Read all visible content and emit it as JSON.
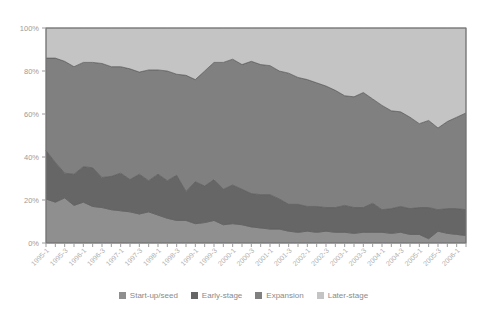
{
  "chart_data": {
    "type": "area",
    "title": "",
    "subtitle": "",
    "xlabel": "",
    "ylabel": "",
    "stacked": true,
    "percent_stacked": true,
    "grid": false,
    "legend_position": "bottom",
    "ylim": [
      0,
      100
    ],
    "ytick_labels": [
      "0%",
      "20%",
      "40%",
      "60%",
      "80%",
      "100%"
    ],
    "ytick_values": [
      0,
      20,
      40,
      60,
      80,
      100
    ],
    "x": [
      "1995-1",
      "1995-2",
      "1995-3",
      "1995-4",
      "1996-1",
      "1996-2",
      "1996-3",
      "1996-4",
      "1997-1",
      "1997-2",
      "1997-3",
      "1997-4",
      "1998-1",
      "1998-2",
      "1998-3",
      "1998-4",
      "1999-1",
      "1999-2",
      "1999-3",
      "1999-4",
      "2000-1",
      "2000-2",
      "2000-3",
      "2000-4",
      "2001-1",
      "2001-2",
      "2001-3",
      "2001-4",
      "2002-1",
      "2002-2",
      "2002-3",
      "2002-4",
      "2003-1",
      "2003-2",
      "2003-3",
      "2003-4",
      "2004-1",
      "2004-2",
      "2004-3",
      "2004-4",
      "2005-1",
      "2005-2",
      "2005-3",
      "2005-4",
      "2006-1",
      "2006-2"
    ],
    "xtick_labels": [
      "1995-1",
      "1995-3",
      "1996-1",
      "1996-3",
      "1997-1",
      "1997-3",
      "1998-1",
      "1998-3",
      "1999-1",
      "1999-3",
      "2000-1",
      "2000-3",
      "2001-1",
      "2001-3",
      "2002-1",
      "2002-3",
      "2003-1",
      "2003-3",
      "2004-1",
      "2004-3",
      "2005-1",
      "2005-3",
      "2006-1"
    ],
    "xtick_every": 2,
    "series": [
      {
        "name": "Start-up/seed",
        "color": "#8f8f8f",
        "values": [
          20.5,
          19.0,
          21.0,
          17.5,
          19.0,
          17.0,
          16.5,
          15.5,
          15.0,
          14.5,
          13.5,
          14.5,
          13.0,
          11.5,
          10.5,
          10.5,
          9.0,
          9.5,
          10.5,
          8.5,
          9.0,
          8.5,
          7.5,
          7.0,
          6.5,
          6.5,
          5.5,
          5.0,
          5.5,
          5.0,
          5.5,
          5.0,
          5.0,
          4.5,
          5.0,
          5.0,
          5.0,
          4.5,
          5.0,
          4.0,
          4.0,
          2.0,
          5.5,
          4.5,
          4.0,
          3.5
        ]
      },
      {
        "name": "Early-stage",
        "color": "#666666",
        "values": [
          22.5,
          18.5,
          11.5,
          14.5,
          16.5,
          18.0,
          14.0,
          15.5,
          17.5,
          15.0,
          18.5,
          14.5,
          19.0,
          17.5,
          21.0,
          13.5,
          19.5,
          17.0,
          19.0,
          16.5,
          18.0,
          16.5,
          15.5,
          15.5,
          16.0,
          14.0,
          12.5,
          13.0,
          11.5,
          12.0,
          11.0,
          11.5,
          12.5,
          12.0,
          11.5,
          13.5,
          10.5,
          11.5,
          12.0,
          12.0,
          12.5,
          14.5,
          10.0,
          11.5,
          12.0,
          12.0
        ]
      },
      {
        "name": "Expansion",
        "color": "#808080",
        "values": [
          43.0,
          48.5,
          52.0,
          50.0,
          48.5,
          49.0,
          53.0,
          51.0,
          49.5,
          51.5,
          47.5,
          51.5,
          48.5,
          51.0,
          47.0,
          54.0,
          47.5,
          53.5,
          54.5,
          59.0,
          58.5,
          58.0,
          61.5,
          60.5,
          60.0,
          59.5,
          61.0,
          59.0,
          59.0,
          57.5,
          56.5,
          54.5,
          51.0,
          51.5,
          53.5,
          48.5,
          48.5,
          45.5,
          44.0,
          42.5,
          39.0,
          40.5,
          38.0,
          40.5,
          42.5,
          45.0
        ]
      },
      {
        "name": "Later-stage",
        "color": "#c4c4c4",
        "values": [
          14.0,
          14.0,
          15.5,
          18.0,
          16.0,
          16.0,
          16.5,
          18.0,
          18.0,
          19.0,
          20.5,
          19.5,
          19.5,
          20.0,
          21.5,
          22.0,
          24.0,
          20.0,
          16.0,
          16.0,
          14.5,
          17.0,
          15.5,
          17.0,
          17.5,
          20.0,
          21.0,
          23.0,
          24.0,
          25.5,
          27.0,
          29.0,
          31.5,
          32.0,
          30.0,
          33.0,
          36.0,
          38.5,
          39.0,
          41.5,
          44.5,
          43.0,
          46.5,
          43.5,
          41.5,
          39.5
        ]
      }
    ]
  },
  "legend": {
    "items": [
      {
        "label": "Start-up/seed",
        "color": "#8f8f8f"
      },
      {
        "label": "Early-stage",
        "color": "#666666"
      },
      {
        "label": "Expansion",
        "color": "#808080"
      },
      {
        "label": "Later-stage",
        "color": "#c4c4c4"
      }
    ]
  },
  "axes": {
    "plot_border_color": "#7a7a7a",
    "tick_color": "#9b9b9b"
  }
}
